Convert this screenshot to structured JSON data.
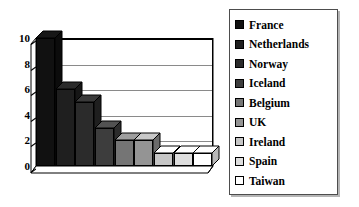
{
  "chart_data": {
    "type": "bar",
    "title": "",
    "subtitle": "",
    "xlabel": "",
    "ylabel": "",
    "categories": [
      "France",
      "Netherlands",
      "Norway",
      "Iceland",
      "Belgium",
      "UK",
      "Ireland",
      "Spain",
      "Taiwan"
    ],
    "values": [
      10,
      6,
      5,
      3,
      2,
      2,
      1,
      1,
      1
    ],
    "ylim": [
      0,
      10
    ],
    "yticks": [
      0,
      2,
      4,
      6,
      8,
      10
    ],
    "ytick_labels": [
      "0",
      "2",
      "4",
      "6",
      "8",
      "10"
    ],
    "grid": true,
    "grid_axis": "y",
    "legend_position": "right",
    "style": "3d-bar",
    "series": [
      {
        "name": "Countries",
        "values": [
          10,
          6,
          5,
          3,
          2,
          2,
          1,
          1,
          1
        ]
      }
    ],
    "bar_colors": [
      "#111111",
      "#1f1f1f",
      "#2b2b2b",
      "#3d3d3d",
      "#757575",
      "#949494",
      "#c6c6c6",
      "#dedede",
      "#ffffff"
    ],
    "legend_entries": [
      {
        "label": "France",
        "color": "#111111"
      },
      {
        "label": "Netherlands",
        "color": "#1f1f1f"
      },
      {
        "label": "Norway",
        "color": "#2b2b2b"
      },
      {
        "label": "Iceland",
        "color": "#3d3d3d"
      },
      {
        "label": "Belgium",
        "color": "#757575"
      },
      {
        "label": "UK",
        "color": "#949494"
      },
      {
        "label": "Ireland",
        "color": "#c6c6c6"
      },
      {
        "label": "Spain",
        "color": "#dedede"
      },
      {
        "label": "Taiwan",
        "color": "#ffffff"
      }
    ],
    "axis_color": "#000000",
    "gridline_color": "#8a8a8a",
    "plot_background": "#ffffff",
    "floor_color": "#ffffff"
  }
}
